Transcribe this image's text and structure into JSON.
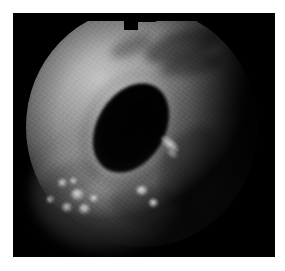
{
  "image": {
    "kind": "endoscopy-photograph",
    "modality_label": "white-light endoscopy",
    "anatomy_label": "gastrointestinal lumen",
    "alt_text": "Grayscale endoscopic photograph showing a circular field of view with a dark elliptical lumen at the centre, surrounding illuminated mucosa, mucosal folds casting shadows in the upper-right, and several small bright specular nodular highlights in the lower-left quadrant.",
    "colors": {
      "page_background": "#ffffff",
      "frame_background": "#000000",
      "mucosa_bright": "#c2c2c2",
      "mucosa_mid": "#8e8e8e",
      "mucosa_dark": "#4a4a4a",
      "lumen": "#000000",
      "highlight": "#eeeeee"
    },
    "frame": {
      "canvas_left": 13,
      "canvas_top": 13,
      "canvas_width": 262,
      "canvas_height": 244
    }
  },
  "features": {
    "lumen": {
      "label": "central lumen",
      "shape": "ellipse",
      "rotation_deg": 31
    },
    "folds": [
      {
        "label": "mucosal-fold-upper-right-1"
      },
      {
        "label": "mucosal-fold-upper-right-2"
      },
      {
        "label": "mucosal-fold-upper-right-3"
      },
      {
        "label": "mucosal-fold-right"
      },
      {
        "label": "mucosal-fold-bottom"
      },
      {
        "label": "mucosal-fold-left"
      }
    ],
    "highlights": [
      {
        "label": "specular-highlight-1"
      },
      {
        "label": "specular-highlight-2"
      },
      {
        "label": "specular-highlight-3"
      },
      {
        "label": "specular-highlight-4"
      },
      {
        "label": "specular-highlight-5"
      },
      {
        "label": "specular-highlight-6"
      },
      {
        "label": "specular-highlight-7"
      },
      {
        "label": "specular-highlight-8"
      },
      {
        "label": "specular-highlight-9"
      },
      {
        "label": "specular-streak-right"
      }
    ],
    "top_notch": {
      "label": "field-of-view-top-notch"
    }
  }
}
